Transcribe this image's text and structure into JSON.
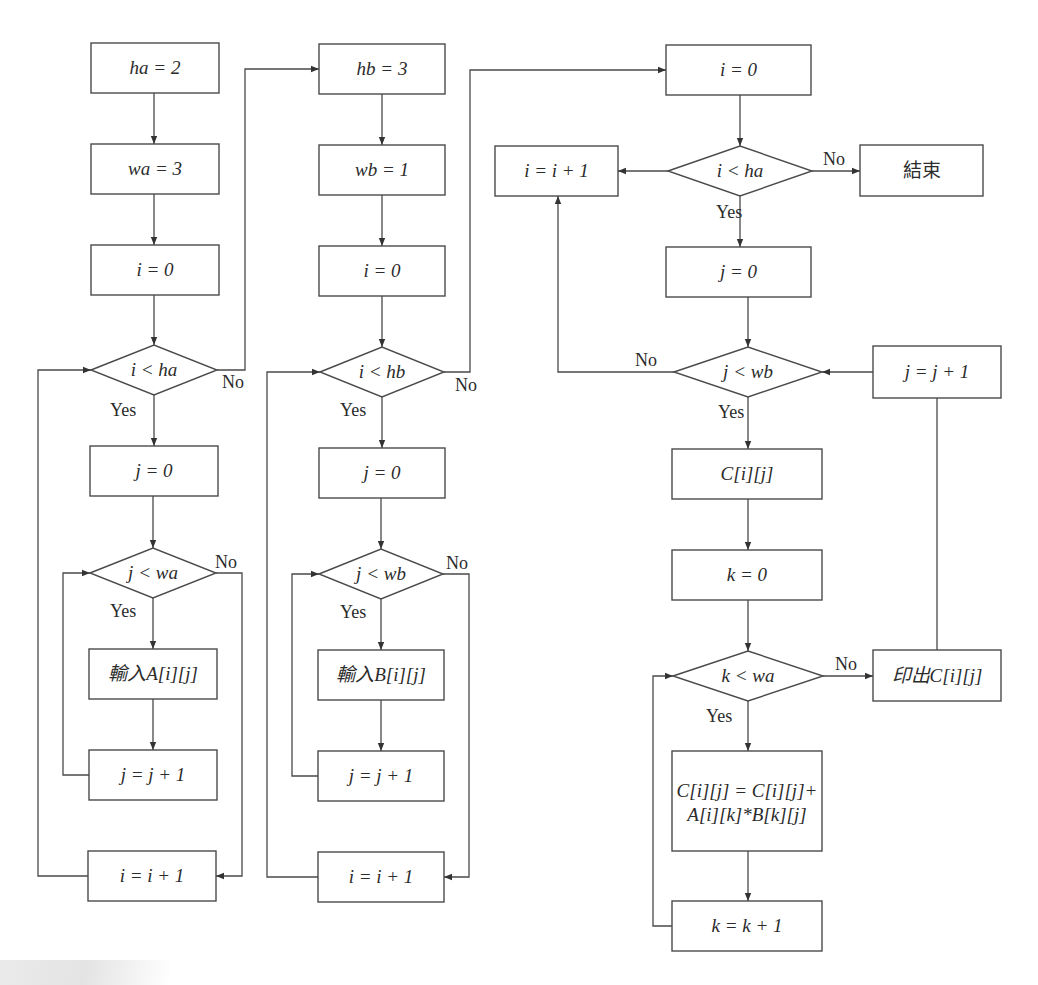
{
  "diagram": {
    "type": "flowchart",
    "colors": {
      "stroke": "#4a4a4a",
      "text": "#2b2b2b",
      "background": "#ffffff"
    },
    "nodes": [
      {
        "id": "a_ha",
        "shape": "process",
        "label": "ha = 2",
        "x": 91,
        "y": 43,
        "w": 128,
        "h": 50
      },
      {
        "id": "a_wa",
        "shape": "process",
        "label": "wa = 3",
        "x": 91,
        "y": 144,
        "w": 128,
        "h": 50
      },
      {
        "id": "a_i0",
        "shape": "process",
        "label": "i = 0",
        "x": 91,
        "y": 245,
        "w": 128,
        "h": 50
      },
      {
        "id": "a_ilt",
        "shape": "decision",
        "label": "i < ha",
        "cx": 154,
        "cy": 370,
        "hw": 63,
        "hh": 25
      },
      {
        "id": "a_j0",
        "shape": "process",
        "label": "j = 0",
        "x": 90,
        "y": 446,
        "w": 128,
        "h": 50
      },
      {
        "id": "a_jlt",
        "shape": "decision",
        "label": "j < wa",
        "cx": 153,
        "cy": 573,
        "hw": 63,
        "hh": 25
      },
      {
        "id": "a_in",
        "shape": "process",
        "label": "輸入A[i][j]",
        "x": 89,
        "y": 649,
        "w": 128,
        "h": 50
      },
      {
        "id": "a_jinc",
        "shape": "process",
        "label": "j = j + 1",
        "x": 89,
        "y": 750,
        "w": 128,
        "h": 50
      },
      {
        "id": "a_iinc",
        "shape": "process",
        "label": "i = i + 1",
        "x": 88,
        "y": 851,
        "w": 128,
        "h": 50
      },
      {
        "id": "b_hb",
        "shape": "process",
        "label": "hb = 3",
        "x": 319,
        "y": 44,
        "w": 126,
        "h": 50
      },
      {
        "id": "b_wb",
        "shape": "process",
        "label": "wb = 1",
        "x": 319,
        "y": 145,
        "w": 126,
        "h": 50
      },
      {
        "id": "b_i0",
        "shape": "process",
        "label": "i = 0",
        "x": 319,
        "y": 246,
        "w": 126,
        "h": 50
      },
      {
        "id": "b_ilt",
        "shape": "decision",
        "label": "i < hb",
        "cx": 382,
        "cy": 372,
        "hw": 62,
        "hh": 25
      },
      {
        "id": "b_j0",
        "shape": "process",
        "label": "j = 0",
        "x": 319,
        "y": 448,
        "w": 126,
        "h": 50
      },
      {
        "id": "b_jlt",
        "shape": "decision",
        "label": "j < wb",
        "cx": 381,
        "cy": 574,
        "hw": 62,
        "hh": 25
      },
      {
        "id": "b_in",
        "shape": "process",
        "label": "輸入B[i][j]",
        "x": 318,
        "y": 650,
        "w": 126,
        "h": 50
      },
      {
        "id": "b_jinc",
        "shape": "process",
        "label": "j = j + 1",
        "x": 318,
        "y": 751,
        "w": 126,
        "h": 50
      },
      {
        "id": "b_iinc",
        "shape": "process",
        "label": "i = i + 1",
        "x": 318,
        "y": 852,
        "w": 126,
        "h": 50
      },
      {
        "id": "c_i0",
        "shape": "process",
        "label": "i = 0",
        "x": 666,
        "y": 45,
        "w": 145,
        "h": 50
      },
      {
        "id": "c_ilt",
        "shape": "decision",
        "label": "i < ha",
        "cx": 740,
        "cy": 171,
        "hw": 72,
        "hh": 25
      },
      {
        "id": "c_iinc",
        "shape": "process",
        "label": "i = i + 1",
        "x": 495,
        "y": 146,
        "w": 123,
        "h": 50
      },
      {
        "id": "c_end",
        "shape": "process",
        "label": "結束",
        "x": 860,
        "y": 145,
        "w": 123,
        "h": 51
      },
      {
        "id": "c_j0",
        "shape": "process",
        "label": "j = 0",
        "x": 666,
        "y": 247,
        "w": 145,
        "h": 50
      },
      {
        "id": "c_jlt",
        "shape": "decision",
        "label": "j < wb",
        "cx": 748,
        "cy": 372,
        "hw": 74,
        "hh": 25
      },
      {
        "id": "c_jinc",
        "shape": "process",
        "label": "j = j + 1",
        "x": 873,
        "y": 346,
        "w": 128,
        "h": 52
      },
      {
        "id": "c_cij",
        "shape": "process",
        "label": "C[i][j]",
        "x": 672,
        "y": 449,
        "w": 150,
        "h": 50
      },
      {
        "id": "c_k0",
        "shape": "process",
        "label": "k = 0",
        "x": 672,
        "y": 550,
        "w": 150,
        "h": 50
      },
      {
        "id": "c_klt",
        "shape": "decision",
        "label": "k < wa",
        "cx": 748,
        "cy": 676,
        "hw": 75,
        "hh": 25
      },
      {
        "id": "c_print",
        "shape": "process",
        "label": "印出C[i][j]",
        "x": 873,
        "y": 650,
        "w": 128,
        "h": 51
      },
      {
        "id": "c_calc",
        "shape": "process",
        "label_line1": "C[i][j] = C[i][j]+",
        "label_line2": "A[i][k]*B[k][j]",
        "x": 672,
        "y": 751,
        "w": 150,
        "h": 100
      },
      {
        "id": "c_kinc",
        "shape": "process",
        "label": "k = k + 1",
        "x": 672,
        "y": 901,
        "w": 150,
        "h": 50
      }
    ],
    "edge_labels": [
      {
        "text": "Yes",
        "x": 110,
        "y": 416
      },
      {
        "text": "No",
        "x": 222,
        "y": 388
      },
      {
        "text": "Yes",
        "x": 110,
        "y": 617
      },
      {
        "text": "No",
        "x": 215,
        "y": 568
      },
      {
        "text": "Yes",
        "x": 340,
        "y": 416
      },
      {
        "text": "No",
        "x": 455,
        "y": 391
      },
      {
        "text": "Yes",
        "x": 340,
        "y": 618
      },
      {
        "text": "No",
        "x": 446,
        "y": 569
      },
      {
        "text": "No",
        "x": 823,
        "y": 165
      },
      {
        "text": "Yes",
        "x": 716,
        "y": 218
      },
      {
        "text": "No",
        "x": 635,
        "y": 366
      },
      {
        "text": "Yes",
        "x": 718,
        "y": 418
      },
      {
        "text": "No",
        "x": 835,
        "y": 670
      },
      {
        "text": "Yes",
        "x": 706,
        "y": 722
      }
    ]
  }
}
